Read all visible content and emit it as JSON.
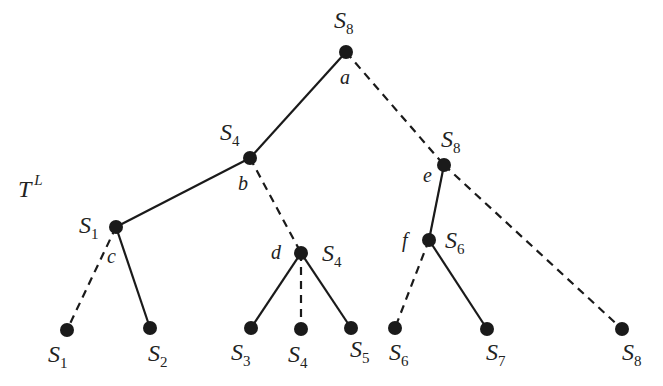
{
  "diagram": {
    "title": "T",
    "title_superscript": "L",
    "colors": {
      "ink": "#1a1a1a",
      "background": "#ffffff"
    },
    "nodes": [
      {
        "id": "a",
        "x": 346,
        "y": 52,
        "letter": "a",
        "strategy": "S",
        "sub": "8"
      },
      {
        "id": "b",
        "x": 250,
        "y": 158,
        "letter": "b",
        "strategy": "S",
        "sub": "4"
      },
      {
        "id": "e",
        "x": 444,
        "y": 165,
        "letter": "e",
        "strategy": "S",
        "sub": "8"
      },
      {
        "id": "c",
        "x": 116,
        "y": 227,
        "letter": "c",
        "strategy": "S",
        "sub": "1"
      },
      {
        "id": "d",
        "x": 301,
        "y": 253,
        "letter": "d",
        "strategy": "S",
        "sub": "4"
      },
      {
        "id": "f",
        "x": 429,
        "y": 240,
        "letter": "f",
        "strategy": "S",
        "sub": "6"
      }
    ],
    "leaves": [
      {
        "id": "l1",
        "x": 67,
        "y": 330,
        "strategy": "S",
        "sub": "1"
      },
      {
        "id": "l2",
        "x": 150,
        "y": 328,
        "strategy": "S",
        "sub": "2"
      },
      {
        "id": "l3",
        "x": 251,
        "y": 328,
        "strategy": "S",
        "sub": "3"
      },
      {
        "id": "l4",
        "x": 301,
        "y": 329,
        "strategy": "S",
        "sub": "4"
      },
      {
        "id": "l5",
        "x": 351,
        "y": 328,
        "strategy": "S",
        "sub": "5"
      },
      {
        "id": "l6",
        "x": 395,
        "y": 328,
        "strategy": "S",
        "sub": "6"
      },
      {
        "id": "l7",
        "x": 487,
        "y": 329,
        "strategy": "S",
        "sub": "7"
      },
      {
        "id": "l8",
        "x": 622,
        "y": 329,
        "strategy": "S",
        "sub": "8"
      }
    ],
    "edges": [
      {
        "from": "a",
        "to": "b",
        "style": "solid"
      },
      {
        "from": "a",
        "to": "e",
        "style": "dashed"
      },
      {
        "from": "b",
        "to": "c",
        "style": "solid"
      },
      {
        "from": "b",
        "to": "d",
        "style": "dashed"
      },
      {
        "from": "c",
        "to": "l1",
        "style": "dashed"
      },
      {
        "from": "c",
        "to": "l2",
        "style": "solid"
      },
      {
        "from": "d",
        "to": "l3",
        "style": "solid"
      },
      {
        "from": "d",
        "to": "l4",
        "style": "dashed"
      },
      {
        "from": "d",
        "to": "l5",
        "style": "solid"
      },
      {
        "from": "e",
        "to": "f",
        "style": "solid"
      },
      {
        "from": "e",
        "to": "l8",
        "style": "dashed"
      },
      {
        "from": "f",
        "to": "l6",
        "style": "dashed"
      },
      {
        "from": "f",
        "to": "l7",
        "style": "solid"
      }
    ]
  }
}
